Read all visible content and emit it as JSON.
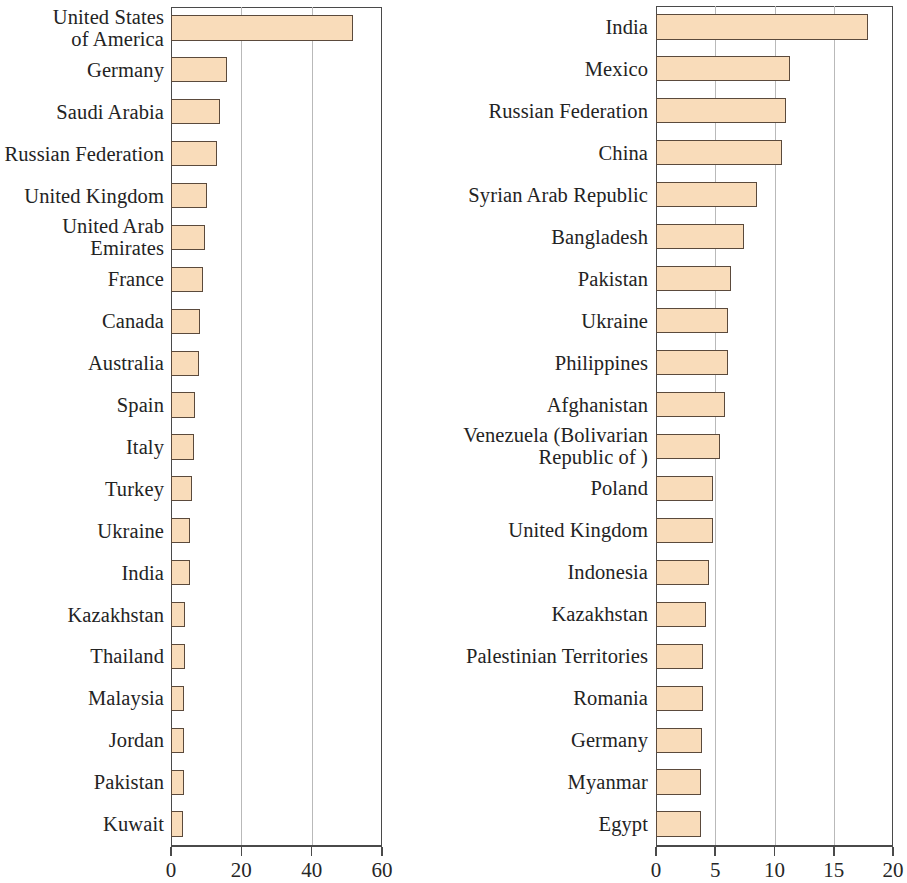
{
  "chart_data": [
    {
      "type": "bar",
      "orientation": "horizontal",
      "panel": "left",
      "title": "",
      "xlabel": "",
      "ylabel": "",
      "xlim": [
        0,
        60
      ],
      "xticks": [
        0,
        20,
        40,
        60
      ],
      "xticklabels": [
        "0",
        "20",
        "40",
        "60"
      ],
      "grid": true,
      "legend": null,
      "bar_color": "#f9dcba",
      "bar_edge_color": "#5b4a3c",
      "categories": [
        "United States\nof America",
        "Germany",
        "Saudi Arabia",
        "Russian Federation",
        "United Kingdom",
        "United Arab\nEmirates",
        "France",
        "Canada",
        "Australia",
        "Spain",
        "Italy",
        "Turkey",
        "Ukraine",
        "India",
        "Kazakhstan",
        "Thailand",
        "Malaysia",
        "Jordan",
        "Pakistan",
        "Kuwait"
      ],
      "values": [
        51.8,
        16.0,
        14.0,
        13.0,
        10.2,
        9.7,
        9.1,
        8.3,
        8.0,
        6.8,
        6.5,
        6.0,
        5.5,
        5.3,
        4.1,
        4.0,
        3.8,
        3.8,
        3.6,
        3.4
      ]
    },
    {
      "type": "bar",
      "orientation": "horizontal",
      "panel": "right",
      "title": "",
      "xlabel": "",
      "ylabel": "",
      "xlim": [
        0,
        20
      ],
      "xticks": [
        0,
        5,
        10,
        15,
        20
      ],
      "xticklabels": [
        "0",
        "5",
        "10",
        "15",
        "20"
      ],
      "grid": true,
      "legend": null,
      "bar_color": "#f9dcba",
      "bar_edge_color": "#5b4a3c",
      "categories": [
        "India",
        "Mexico",
        "Russian Federation",
        "China",
        "Syrian Arab Republic",
        "Bangladesh",
        "Pakistan",
        "Ukraine",
        "Philippines",
        "Afghanistan",
        "Venezuela (Bolivarian\nRepublic of )",
        "Poland",
        "United Kingdom",
        "Indonesia",
        "Kazakhstan",
        "Palestinian Territories",
        "Romania",
        "Germany",
        "Myanmar",
        "Egypt"
      ],
      "values": [
        17.9,
        11.3,
        11.0,
        10.6,
        8.5,
        7.4,
        6.3,
        6.1,
        6.1,
        5.8,
        5.4,
        4.8,
        4.8,
        4.5,
        4.2,
        4.0,
        4.0,
        3.9,
        3.8,
        3.8
      ]
    }
  ]
}
